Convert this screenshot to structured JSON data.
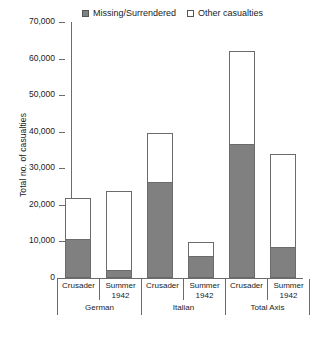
{
  "chart_data": {
    "type": "bar",
    "subtype": "stacked",
    "title": "",
    "xlabel": "",
    "ylabel": "Total no. of casualties",
    "ylim": [
      0,
      70000
    ],
    "ytick_labels": [
      "70,000",
      "60,000",
      "50,000",
      "40,000",
      "30,000",
      "20,000",
      "10,000",
      "0"
    ],
    "ytick_values": [
      70000,
      60000,
      50000,
      40000,
      30000,
      20000,
      10000,
      0
    ],
    "grid": false,
    "legend_position": "top",
    "groups": [
      "German",
      "Italian",
      "Total Axis"
    ],
    "categories": [
      "Crusader",
      "Summer 1942",
      "Crusader",
      "Summer 1942",
      "Crusader",
      "Summer 1942"
    ],
    "series": [
      {
        "name": "Missing/Surrendered",
        "color": "#808080",
        "values": [
          10700,
          2200,
          26200,
          6000,
          36700,
          8600
        ]
      },
      {
        "name": "Other casualties",
        "color": "#ffffff",
        "values": [
          11300,
          21600,
          13500,
          3900,
          25300,
          25400
        ]
      }
    ],
    "totals": [
      22000,
      23800,
      39700,
      9900,
      62000,
      34000
    ]
  },
  "legend": {
    "entries": [
      {
        "label": "Missing/Surrendered",
        "swatch": "filled-square-icon"
      },
      {
        "label": "Other casualties",
        "swatch": "hollow-square-icon"
      }
    ]
  },
  "axis": {
    "y_title": "Total no. of casualties"
  },
  "x_axis": {
    "sub_labels": [
      {
        "line1": "Crusader",
        "line2": ""
      },
      {
        "line1": "Summer",
        "line2": "1942"
      },
      {
        "line1": "Crusader",
        "line2": ""
      },
      {
        "line1": "Summer",
        "line2": "1942"
      },
      {
        "line1": "Crusader",
        "line2": ""
      },
      {
        "line1": "Summer",
        "line2": "1942"
      }
    ],
    "groups": [
      "German",
      "Italian",
      "Total Axis"
    ]
  }
}
